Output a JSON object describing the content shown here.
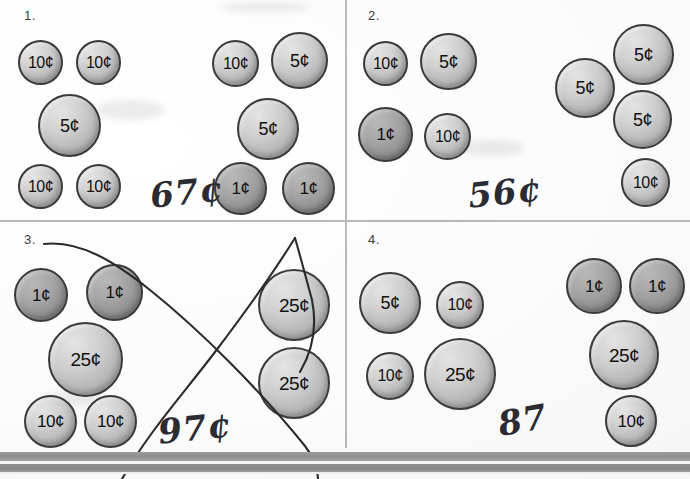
{
  "worksheet": {
    "title": "Count the coins worksheet",
    "bottom_bar": "page-edge-bar"
  },
  "problems": [
    {
      "number": "1.",
      "answer": "67¢",
      "coins": [
        {
          "value": "10¢",
          "metal": "silver"
        },
        {
          "value": "10¢",
          "metal": "silver"
        },
        {
          "value": "5¢",
          "metal": "silver"
        },
        {
          "value": "10¢",
          "metal": "silver"
        },
        {
          "value": "10¢",
          "metal": "silver"
        },
        {
          "value": "10¢",
          "metal": "silver"
        },
        {
          "value": "5¢",
          "metal": "silver"
        },
        {
          "value": "5¢",
          "metal": "silver"
        },
        {
          "value": "1¢",
          "metal": "copper"
        },
        {
          "value": "1¢",
          "metal": "copper"
        }
      ]
    },
    {
      "number": "2.",
      "answer": "56¢",
      "coins": [
        {
          "value": "10¢",
          "metal": "silver"
        },
        {
          "value": "5¢",
          "metal": "silver"
        },
        {
          "value": "1¢",
          "metal": "copper"
        },
        {
          "value": "10¢",
          "metal": "silver"
        },
        {
          "value": "5¢",
          "metal": "silver"
        },
        {
          "value": "5¢",
          "metal": "silver"
        },
        {
          "value": "5¢",
          "metal": "silver"
        },
        {
          "value": "10¢",
          "metal": "silver"
        }
      ]
    },
    {
      "number": "3.",
      "answer": "97¢",
      "crossed_out": true,
      "coins": [
        {
          "value": "1¢",
          "metal": "copper"
        },
        {
          "value": "1¢",
          "metal": "copper"
        },
        {
          "value": "25¢",
          "metal": "silver"
        },
        {
          "value": "10¢",
          "metal": "silver"
        },
        {
          "value": "10¢",
          "metal": "silver"
        },
        {
          "value": "25¢",
          "metal": "silver"
        },
        {
          "value": "25¢",
          "metal": "silver"
        }
      ]
    },
    {
      "number": "4.",
      "answer": "87",
      "coins": [
        {
          "value": "5¢",
          "metal": "silver"
        },
        {
          "value": "10¢",
          "metal": "silver"
        },
        {
          "value": "10¢",
          "metal": "silver"
        },
        {
          "value": "25¢",
          "metal": "silver"
        },
        {
          "value": "1¢",
          "metal": "copper"
        },
        {
          "value": "1¢",
          "metal": "copper"
        },
        {
          "value": "25¢",
          "metal": "silver"
        },
        {
          "value": "10¢",
          "metal": "silver"
        }
      ]
    }
  ],
  "colors": {
    "divider": "#b9b9ba",
    "coin_outline": "#3a3a3a",
    "ink": "#2b2b33",
    "bar": "#8e8e8e"
  }
}
